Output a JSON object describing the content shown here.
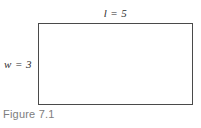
{
  "figure": {
    "caption": "Figure 7.1",
    "shape": "rectangle",
    "labels": {
      "length": "l = 5",
      "width": "w = 3"
    },
    "dimensions": {
      "length_value": 5,
      "width_value": 3
    },
    "colors": {
      "stroke": "#4a4a4a",
      "fill": "#ffffff",
      "label_text": "#2e2e2e",
      "caption_text": "#7d7d7d",
      "background": "#ffffff"
    }
  }
}
